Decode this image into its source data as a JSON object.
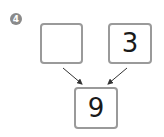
{
  "problem": {
    "number": "4",
    "badge_color": "#8a8a8a"
  },
  "number_bond": {
    "part_left": "",
    "part_right": "3",
    "whole": "9",
    "box_border_color": "#9a9a9a",
    "arrow_color": "#333333"
  }
}
